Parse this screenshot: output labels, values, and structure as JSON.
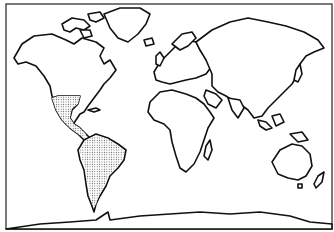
{
  "map": {
    "type": "world outline map",
    "projection": "equirectangular-like",
    "highlighted_region": {
      "name": "southern North America, Central America and South America",
      "fill": "stippled dots",
      "dot_color": "#555555"
    },
    "colors": {
      "background": "#ffffff",
      "outline": "#111111",
      "frame": "#333333"
    },
    "legend": null,
    "labels": []
  }
}
